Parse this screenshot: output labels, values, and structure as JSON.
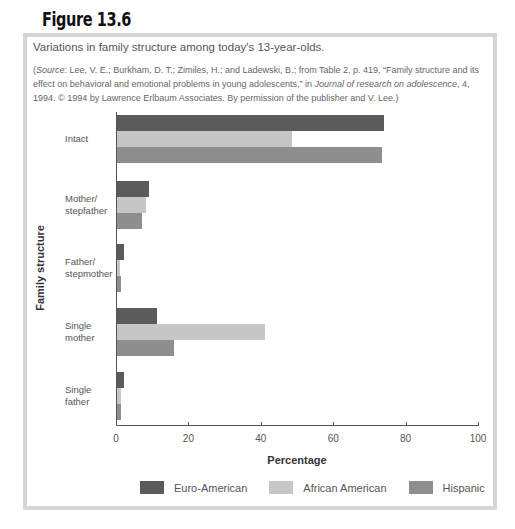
{
  "figure": {
    "number": "Figure 13.6",
    "caption": "Variations in family structure among today's 13-year-olds.",
    "source_prefix": "(",
    "source_label": "Source",
    "source_text_1": ": Lee, V. E.; Burkham, D. T.; Zimiles, H.; and Ladewski, B.; from Table 2, p. 419, “Family structure and its effect on behavioral and emotional problems in young adolescents,” in ",
    "source_journal": "Journal of research on adolescence",
    "source_text_2": ", 4, 1994. © 1994 by Lawrence Erlbaum Associates. By permission of the publisher and V. Lee.)"
  },
  "colors": {
    "euro_american": "#5b5b5b",
    "african_american": "#c6c6c6",
    "hispanic": "#8e8e8e",
    "frame": "#d6d6d6"
  },
  "chart_data": {
    "type": "bar",
    "orientation": "horizontal",
    "title": "Variations in family structure among today's 13-year-olds.",
    "xlabel": "Percentage",
    "ylabel": "Family structure",
    "xlim": [
      0,
      100
    ],
    "xticks": [
      0,
      20,
      40,
      60,
      80,
      100
    ],
    "grid": false,
    "legend_position": "bottom",
    "categories": [
      "Intact",
      "Mother/ stepfather",
      "Father/ stepmother",
      "Single mother",
      "Single father"
    ],
    "category_lines": [
      [
        "Intact"
      ],
      [
        "Mother/",
        "stepfather"
      ],
      [
        "Father/",
        "stepmother"
      ],
      [
        "Single",
        "mother"
      ],
      [
        "Single",
        "father"
      ]
    ],
    "series": [
      {
        "name": "Euro-American",
        "values": [
          74,
          9,
          2,
          11,
          2
        ]
      },
      {
        "name": "African American",
        "values": [
          48.5,
          8,
          0.8,
          41,
          1.2
        ]
      },
      {
        "name": "Hispanic",
        "values": [
          73.5,
          7,
          1.2,
          15.8,
          1.2
        ]
      }
    ]
  }
}
